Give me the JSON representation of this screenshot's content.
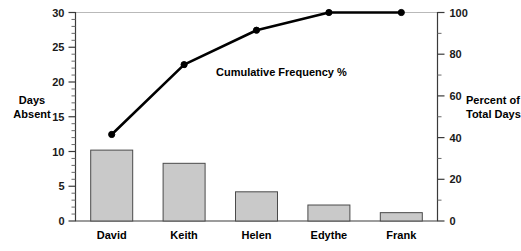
{
  "chart_data": {
    "type": "bar",
    "title": "",
    "subtitle": "",
    "categories": [
      "David",
      "Keith",
      "Helen",
      "Edythe",
      "Frank"
    ],
    "series": [
      {
        "name": "Days Absent",
        "type": "bar",
        "axis": "left",
        "values": [
          10.2,
          8.3,
          4.2,
          2.3,
          1.2
        ]
      },
      {
        "name": "Cumulative Frequency %",
        "type": "line",
        "axis": "right",
        "values": [
          41.5,
          75.0,
          91.5,
          100.0,
          100.0
        ]
      }
    ],
    "xlabel": "",
    "ylabel": "Days Absent",
    "y2label": "Percent of Total Days",
    "ylim": [
      0,
      30
    ],
    "y2lim": [
      0,
      100
    ],
    "yticks": [
      "0",
      "5",
      "10",
      "15",
      "20",
      "25",
      "30"
    ],
    "ytick_values": [
      0,
      5,
      10,
      15,
      20,
      25,
      30
    ],
    "y2ticks": [
      "0",
      "20",
      "40",
      "60",
      "80",
      "100"
    ],
    "y2tick_values": [
      0,
      20,
      40,
      60,
      80,
      100
    ],
    "y_minor_step": 1,
    "y2_minor_step": 10,
    "grid": false,
    "legend": "none",
    "annotations": [
      {
        "text": "Cumulative Frequency %",
        "x_px": 216,
        "y_px": 76
      }
    ]
  },
  "axes": {
    "left": {
      "title_line1": "Days",
      "title_line2": "Absent"
    },
    "right": {
      "title_line1": "Percent of",
      "title_line2": "Total Days"
    }
  },
  "colors": {
    "bar_fill": "#c9c9c9",
    "bar_stroke": "#4a4a4a",
    "line": "#000000",
    "axis": "#3a3a3a",
    "top_rule": "#b9b9b9",
    "text": "#000000",
    "background": "#ffffff"
  }
}
